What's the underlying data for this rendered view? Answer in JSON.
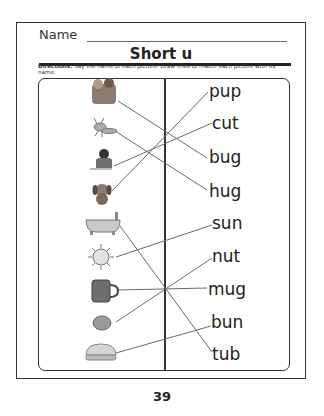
{
  "header": {
    "name_label": "Name"
  },
  "title": "Short u",
  "directions": {
    "label": "Directions:",
    "text": " Say the name of each picture. Draw lines to match each picture with its name."
  },
  "pictures": [
    {
      "icon": "family-hug-icon",
      "y": 93
    },
    {
      "icon": "ant-bug-icon",
      "y": 128
    },
    {
      "icon": "boy-cutting-icon",
      "y": 163
    },
    {
      "icon": "puppy-icon",
      "y": 193
    },
    {
      "icon": "bathtub-icon",
      "y": 225
    },
    {
      "icon": "sun-icon",
      "y": 257
    },
    {
      "icon": "mug-icon",
      "y": 289
    },
    {
      "icon": "nut-icon",
      "y": 321
    },
    {
      "icon": "bun-icon",
      "y": 355
    }
  ],
  "words": [
    "pup",
    "cut",
    "bug",
    "hug",
    "sun",
    "nut",
    "mug",
    "bun",
    "tub"
  ],
  "page_number": "39",
  "colors": {
    "line": "#6a6a6a",
    "border": "#333333"
  }
}
